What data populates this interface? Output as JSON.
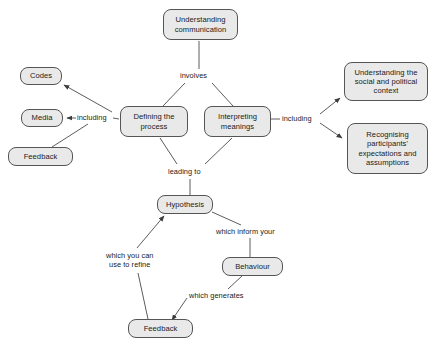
{
  "diagram": {
    "style": {
      "node_fill": "#e9e9e9",
      "node_border": "#555555",
      "line_color": "#4a4a4a",
      "text_color": "#1a1a1a",
      "background": "#ffffff"
    },
    "nodes": [
      {
        "id": "understanding-communication",
        "label": "Understanding\ncommunication",
        "x": 163,
        "y": 9,
        "w": 75,
        "h": 31
      },
      {
        "id": "codes",
        "label": "Codes",
        "x": 20,
        "y": 67,
        "w": 42,
        "h": 18
      },
      {
        "id": "media",
        "label": "Media",
        "x": 21,
        "y": 109,
        "w": 42,
        "h": 18
      },
      {
        "id": "feedback-left",
        "label": "Feedback",
        "x": 8,
        "y": 147,
        "w": 65,
        "h": 19
      },
      {
        "id": "defining-the-process",
        "label": "Defining the\nprocess",
        "x": 120,
        "y": 106,
        "w": 68,
        "h": 31
      },
      {
        "id": "interpreting-meanings",
        "label": "Interpreting\nmeanings",
        "x": 204,
        "y": 106,
        "w": 67,
        "h": 31
      },
      {
        "id": "understanding-social-political-context",
        "label": "Understanding the\nsocial and political\ncontext",
        "x": 344,
        "y": 62,
        "w": 84,
        "h": 39
      },
      {
        "id": "recognising-participants-expectations",
        "label": "Recognising\nparticipants'\nexpectations and\nassumptions",
        "x": 347,
        "y": 123,
        "w": 81,
        "h": 51
      },
      {
        "id": "hypothesis",
        "label": "Hypothesis",
        "x": 157,
        "y": 195,
        "w": 56,
        "h": 19
      },
      {
        "id": "behaviour",
        "label": "Behaviour",
        "x": 222,
        "y": 257,
        "w": 61,
        "h": 19
      },
      {
        "id": "feedback-bottom",
        "label": "Feedback",
        "x": 128,
        "y": 319,
        "w": 65,
        "h": 19
      }
    ],
    "edge_labels": [
      {
        "id": "involves",
        "text": "involves",
        "x": 180,
        "y": 71
      },
      {
        "id": "including-left",
        "text": "including",
        "x": 77,
        "y": 113
      },
      {
        "id": "including-right",
        "text": "including",
        "x": 282,
        "y": 114
      },
      {
        "id": "leading-to",
        "text": "leading to",
        "x": 168,
        "y": 167
      },
      {
        "id": "which-inform-your",
        "text": "which inform your",
        "x": 216,
        "y": 227
      },
      {
        "id": "which-you-can-use-to-refine",
        "text": "which you can\nuse to refine",
        "x": 106,
        "y": 251
      },
      {
        "id": "which-generates",
        "text": "which generates",
        "x": 189,
        "y": 291
      }
    ],
    "edges": [
      {
        "id": "understanding-to-involves",
        "from": "understanding-communication",
        "to": "involves",
        "arrow": false
      },
      {
        "id": "involves-to-defining",
        "from": "involves",
        "to": "defining-the-process",
        "arrow": false
      },
      {
        "id": "involves-to-interpreting",
        "from": "involves",
        "to": "interpreting-meanings",
        "arrow": false
      },
      {
        "id": "defining-to-including-left",
        "from": "defining-the-process",
        "to": "including-left",
        "arrow": false
      },
      {
        "id": "including-left-to-codes",
        "from": "including-left",
        "to": "codes",
        "arrow": true
      },
      {
        "id": "including-left-to-media",
        "from": "including-left",
        "to": "media",
        "arrow": true
      },
      {
        "id": "including-left-to-feedback",
        "from": "including-left",
        "to": "feedback-left",
        "arrow": false
      },
      {
        "id": "interpreting-to-including-right",
        "from": "interpreting-meanings",
        "to": "including-right",
        "arrow": false
      },
      {
        "id": "including-right-to-context",
        "from": "including-right",
        "to": "understanding-social-political-context",
        "arrow": true
      },
      {
        "id": "including-right-to-recognising",
        "from": "including-right",
        "to": "recognising-participants-expectations",
        "arrow": true
      },
      {
        "id": "defining-to-leading-to",
        "from": "defining-the-process",
        "to": "leading-to",
        "arrow": false
      },
      {
        "id": "interpreting-to-leading-to",
        "from": "interpreting-meanings",
        "to": "leading-to",
        "arrow": false
      },
      {
        "id": "leading-to-hypothesis",
        "from": "leading-to",
        "to": "hypothesis",
        "arrow": false
      },
      {
        "id": "hypothesis-to-which-inform",
        "from": "hypothesis",
        "to": "which-inform-your",
        "arrow": false
      },
      {
        "id": "which-inform-to-behaviour",
        "from": "which-inform-your",
        "to": "behaviour",
        "arrow": false
      },
      {
        "id": "behaviour-to-which-generates",
        "from": "behaviour",
        "to": "which-generates",
        "arrow": false
      },
      {
        "id": "which-generates-to-feedback",
        "from": "which-generates",
        "to": "feedback-bottom",
        "arrow": true
      },
      {
        "id": "feedback-to-which-you-can-use",
        "from": "feedback-bottom",
        "to": "which-you-can-use-to-refine",
        "arrow": false
      },
      {
        "id": "which-you-can-use-to-hypothesis",
        "from": "which-you-can-use-to-refine",
        "to": "hypothesis",
        "arrow": true
      }
    ]
  }
}
